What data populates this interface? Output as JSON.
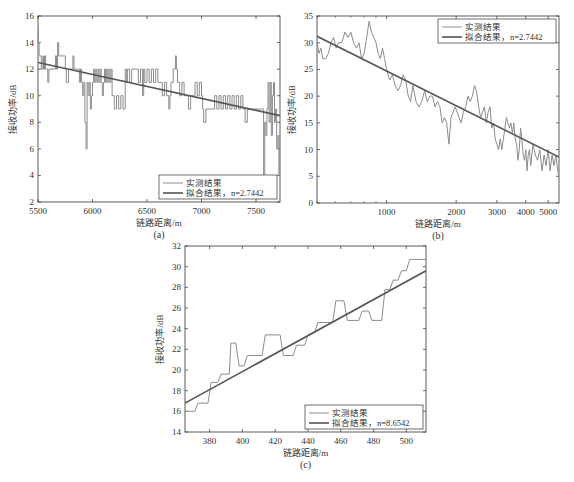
{
  "figure": {
    "colors": {
      "measured": "#8c8c8c",
      "fit": "#555555",
      "axis": "#333333",
      "text": "#333333"
    },
    "legend_labels": {
      "measured": "实测结果",
      "fit_prefix": "拟合结果，",
      "fit_var": "n"
    }
  },
  "chart_data": [
    {
      "id": "a",
      "type": "line",
      "caption": "(a)",
      "xlabel": "链路距离/m",
      "ylabel": "接收功率/dB",
      "xscale": "linear",
      "xlim": [
        5500,
        7720
      ],
      "ylim": [
        2,
        16
      ],
      "xticks": [
        5500,
        6000,
        6500,
        7000,
        7500
      ],
      "yticks": [
        2,
        4,
        6,
        8,
        10,
        12,
        14,
        16
      ],
      "legend_position": "lower right",
      "box": {
        "left": 38,
        "top": 16,
        "right": 280,
        "bottom": 202
      },
      "series": [
        {
          "name": "实测结果",
          "style": "step",
          "x": [
            5500,
            5505,
            5510,
            5530,
            5545,
            5550,
            5560,
            5570,
            5580,
            5590,
            5600,
            5610,
            5640,
            5660,
            5670,
            5680,
            5690,
            5700,
            5730,
            5750,
            5760,
            5780,
            5800,
            5820,
            5830,
            5840,
            5860,
            5880,
            5890,
            5900,
            5910,
            5920,
            5930,
            5940,
            5950,
            5960,
            5970,
            5980,
            5990,
            6000,
            6010,
            6020,
            6030,
            6040,
            6050,
            6060,
            6070,
            6080,
            6090,
            6100,
            6110,
            6120,
            6130,
            6140,
            6150,
            6160,
            6170,
            6180,
            6200,
            6210,
            6220,
            6240,
            6260,
            6280,
            6300,
            6310,
            6320,
            6340,
            6360,
            6380,
            6400,
            6420,
            6440,
            6460,
            6470,
            6480,
            6500,
            6520,
            6540,
            6560,
            6580,
            6600,
            6620,
            6640,
            6660,
            6680,
            6700,
            6710,
            6720,
            6740,
            6760,
            6770,
            6780,
            6800,
            6820,
            6840,
            6860,
            6880,
            6900,
            6920,
            6940,
            6960,
            6980,
            7000,
            7010,
            7020,
            7040,
            7060,
            7080,
            7100,
            7120,
            7140,
            7160,
            7180,
            7200,
            7220,
            7240,
            7260,
            7280,
            7300,
            7320,
            7340,
            7360,
            7380,
            7400,
            7420,
            7440,
            7460,
            7480,
            7500,
            7520,
            7540,
            7560,
            7570,
            7580,
            7590,
            7600,
            7610,
            7620,
            7630,
            7640,
            7650,
            7660,
            7670,
            7680,
            7690,
            7700,
            7710,
            7720
          ],
          "y": [
            15,
            14,
            13,
            12,
            13,
            12,
            13,
            12,
            12,
            11,
            12,
            12,
            12,
            13,
            12,
            14,
            13,
            13,
            13,
            12,
            11,
            12,
            12,
            13,
            12,
            12,
            12,
            11,
            12,
            11,
            10,
            11,
            8,
            6,
            11,
            10,
            11,
            9,
            10,
            11,
            12,
            11,
            12,
            11,
            12,
            11,
            12,
            11,
            10,
            11,
            12,
            11,
            12,
            11,
            12,
            11,
            12,
            10,
            9,
            9,
            10,
            9,
            10,
            9,
            12,
            11,
            12,
            11,
            12,
            12,
            12,
            11,
            12,
            10,
            12,
            11,
            12,
            11,
            12,
            11,
            12,
            11,
            11,
            10,
            11,
            10,
            9,
            10,
            11,
            12,
            13,
            12,
            11,
            10,
            11,
            10,
            10,
            9,
            10,
            10,
            11,
            10,
            11,
            10,
            9,
            8,
            9,
            9,
            9,
            9,
            10,
            9,
            10,
            9,
            10,
            9,
            10,
            9,
            10,
            9,
            10,
            9,
            10,
            9,
            8,
            9,
            9,
            9,
            9,
            9,
            9,
            9,
            9,
            4,
            8,
            7,
            9,
            11,
            8,
            11,
            7,
            10,
            11,
            8,
            9,
            6,
            7,
            4,
            7
          ],
          "color_key": "measured"
        },
        {
          "name": "拟合结果，n=2.7442",
          "style": "line",
          "x": [
            5500,
            7720
          ],
          "y": [
            12.5,
            8.5
          ],
          "color_key": "fit"
        }
      ],
      "legend": [
        "实测结果",
        "拟合结果，n=2.7442"
      ]
    },
    {
      "id": "b",
      "type": "line",
      "caption": "(b)",
      "xlabel": "链路距离/m",
      "ylabel": "接收功率/dB",
      "xscale": "log",
      "xlim": [
        500,
        5570
      ],
      "ylim": [
        0,
        35
      ],
      "xticks": [
        1000,
        2000,
        3000,
        4000,
        5000
      ],
      "yticks": [
        0,
        5,
        10,
        15,
        20,
        25,
        30,
        35
      ],
      "legend_position": "upper right",
      "box": {
        "left": 317,
        "top": 16,
        "right": 559,
        "bottom": 203
      },
      "series": [
        {
          "name": "实测结果",
          "style": "line",
          "x": [
            500,
            510,
            520,
            530,
            545,
            560,
            575,
            590,
            605,
            620,
            640,
            660,
            680,
            700,
            720,
            740,
            760,
            780,
            800,
            820,
            840,
            860,
            880,
            900,
            920,
            940,
            960,
            980,
            1000,
            1030,
            1060,
            1090,
            1120,
            1150,
            1180,
            1210,
            1240,
            1270,
            1300,
            1340,
            1380,
            1420,
            1460,
            1500,
            1540,
            1580,
            1620,
            1660,
            1700,
            1740,
            1780,
            1820,
            1860,
            1900,
            1940,
            1980,
            2020,
            2060,
            2100,
            2150,
            2200,
            2250,
            2300,
            2350,
            2400,
            2450,
            2500,
            2550,
            2600,
            2650,
            2700,
            2750,
            2800,
            2850,
            2900,
            2950,
            3000,
            3050,
            3100,
            3150,
            3200,
            3250,
            3300,
            3350,
            3400,
            3450,
            3500,
            3550,
            3600,
            3650,
            3700,
            3750,
            3800,
            3850,
            3900,
            3950,
            4000,
            4050,
            4100,
            4150,
            4200,
            4300,
            4400,
            4500,
            4600,
            4700,
            4800,
            4900,
            5000,
            5100,
            5200,
            5300,
            5400,
            5500,
            5570
          ],
          "y": [
            30,
            28,
            29,
            27,
            27,
            28,
            30,
            31,
            29,
            30,
            30,
            32,
            31,
            32,
            30,
            29,
            30,
            27,
            28,
            31,
            34,
            32,
            31,
            30,
            28,
            27,
            29,
            27,
            25,
            23,
            24,
            22,
            21,
            22,
            24,
            23,
            20,
            19,
            22,
            19,
            18,
            19,
            21,
            19,
            20,
            20,
            18,
            19,
            18,
            15,
            16,
            15,
            11,
            16,
            17,
            18,
            17,
            16,
            15,
            17,
            18,
            20,
            19,
            20,
            22,
            21,
            18,
            16,
            17,
            18,
            15,
            17,
            18,
            14,
            15,
            12,
            11,
            10,
            12,
            10,
            12,
            14,
            16,
            15,
            14,
            15,
            13,
            15,
            12,
            11,
            8,
            10,
            14,
            12,
            9,
            8,
            10,
            6,
            9,
            10,
            7,
            11,
            9,
            8,
            10,
            6,
            9,
            7,
            10,
            6,
            9,
            7,
            9,
            6,
            5
          ],
          "color_key": "measured"
        },
        {
          "name": "拟合结果，n=2.7442",
          "style": "line",
          "x": [
            500,
            5570
          ],
          "y": [
            31.2,
            8.6
          ],
          "color_key": "fit"
        }
      ],
      "legend": [
        "实测结果",
        "拟合结果，n=2.7442"
      ]
    },
    {
      "id": "c",
      "type": "line",
      "caption": "(c)",
      "xlabel": "链路距离/m",
      "ylabel": "接收功率/dB",
      "xscale": "linear",
      "xlim": [
        365,
        512
      ],
      "ylim": [
        14,
        32
      ],
      "xticks": [
        380,
        400,
        420,
        440,
        460,
        480,
        500
      ],
      "yticks": [
        14,
        16,
        18,
        20,
        22,
        24,
        26,
        28,
        30,
        32
      ],
      "legend_position": "lower right",
      "box": {
        "left": 185,
        "top": 246,
        "right": 426,
        "bottom": 432
      },
      "series": [
        {
          "name": "实测结果",
          "style": "line",
          "x": [
            365,
            371,
            373,
            379,
            381,
            385,
            387,
            392,
            393,
            396,
            398,
            401,
            403,
            412,
            414,
            423,
            425,
            431,
            433,
            438,
            440,
            444,
            446,
            455,
            457,
            462,
            464,
            471,
            473,
            477,
            479,
            485,
            487,
            490,
            492,
            495,
            497,
            500,
            502,
            512
          ],
          "y": [
            16,
            16,
            16.8,
            16.8,
            18.8,
            18.8,
            19.6,
            19.6,
            22.6,
            22.6,
            20.4,
            20.4,
            21.4,
            21.4,
            23.4,
            23.4,
            21.4,
            21.4,
            22.4,
            22.4,
            23.4,
            23.6,
            24.6,
            24.6,
            26.7,
            26.7,
            24.8,
            24.8,
            25.7,
            25.7,
            24.8,
            24.8,
            27.8,
            27.8,
            28.7,
            28.7,
            29.6,
            29.6,
            30.7,
            30.7
          ],
          "color_key": "measured"
        },
        {
          "name": "拟合结果，n=8.6542",
          "style": "line",
          "x": [
            365,
            512
          ],
          "y": [
            16.8,
            29.6
          ],
          "color_key": "fit"
        }
      ],
      "legend": [
        "实测结果",
        "拟合结果，n=8.6542"
      ]
    }
  ]
}
